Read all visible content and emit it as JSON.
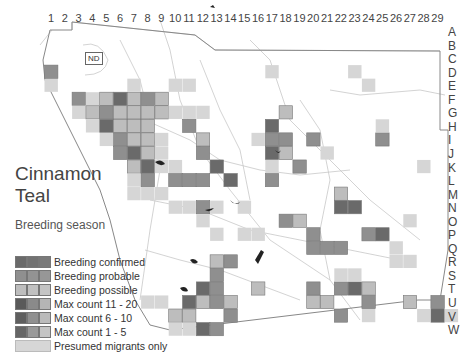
{
  "map": {
    "title_line1": "Cinnamon",
    "title_line2": "Teal",
    "subtitle": "Breeding season",
    "nd_label": "ND",
    "columns": [
      "1",
      "2",
      "3",
      "4",
      "5",
      "6",
      "7",
      "8",
      "9",
      "10",
      "11",
      "12",
      "13",
      "14",
      "15",
      "16",
      "17",
      "18",
      "19",
      "20",
      "21",
      "22",
      "23",
      "24",
      "25",
      "26",
      "27",
      "28",
      "29"
    ],
    "rows": [
      "A",
      "B",
      "C",
      "D",
      "E",
      "F",
      "G",
      "H",
      "I",
      "J",
      "K",
      "L",
      "M",
      "N",
      "O",
      "P",
      "Q",
      "R",
      "S",
      "T",
      "U",
      "V",
      "W"
    ],
    "colors": {
      "confirmed": "#6a6a6a",
      "probable": "#8f8f8f",
      "possible": "#bdbdbd",
      "migrant": "#d6d6d6",
      "border": "#888888",
      "roads": "#c8c8c8",
      "water": "#222222"
    }
  },
  "legend": {
    "items": [
      {
        "label": "Breeding confirmed",
        "swatches": [
          "#6a6a6a",
          "#6a6a6a",
          "#6a6a6a"
        ]
      },
      {
        "label": "Breeding probable",
        "swatches": [
          "#8f8f8f",
          "#8f8f8f",
          "#8f8f8f"
        ]
      },
      {
        "label": "Breeding possible",
        "swatches": [
          "#bdbdbd",
          "#bdbdbd",
          "#bdbdbd"
        ]
      },
      {
        "label": "Max count 11 - 20",
        "swatches": [
          "#5a5a5a",
          "#8a8a8a",
          "#b5b5b5"
        ]
      },
      {
        "label": "Max count 6 - 10",
        "swatches": [
          "#5f5f5f",
          "#909090",
          "#bbbbbb"
        ]
      },
      {
        "label": "Max count 1 - 5",
        "swatches": [
          "#666666",
          "#999999",
          "#c4c4c4"
        ]
      },
      {
        "label": "Presumed migrants only",
        "swatches": [
          "#d6d6d6"
        ]
      }
    ]
  },
  "squares": [
    {
      "c": 1,
      "r": "D",
      "s": "migrant"
    },
    {
      "c": 1,
      "r": "C",
      "s": "probable"
    },
    {
      "c": 3,
      "r": "E",
      "s": "probable"
    },
    {
      "c": 4,
      "r": "E",
      "s": "migrant"
    },
    {
      "c": 5,
      "r": "E",
      "s": "possible"
    },
    {
      "c": 6,
      "r": "E",
      "s": "confirmed"
    },
    {
      "c": 7,
      "r": "E",
      "s": "possible"
    },
    {
      "c": 8,
      "r": "E",
      "s": "probable"
    },
    {
      "c": 9,
      "r": "E",
      "s": "possible"
    },
    {
      "c": 7,
      "r": "D",
      "s": "migrant"
    },
    {
      "c": 10,
      "r": "D",
      "s": "migrant"
    },
    {
      "c": 11,
      "r": "D",
      "s": "migrant"
    },
    {
      "c": 3,
      "r": "F",
      "s": "migrant"
    },
    {
      "c": 4,
      "r": "F",
      "s": "possible"
    },
    {
      "c": 5,
      "r": "F",
      "s": "probable"
    },
    {
      "c": 6,
      "r": "F",
      "s": "possible"
    },
    {
      "c": 7,
      "r": "F",
      "s": "possible"
    },
    {
      "c": 8,
      "r": "F",
      "s": "possible"
    },
    {
      "c": 9,
      "r": "F",
      "s": "possible"
    },
    {
      "c": 10,
      "r": "F",
      "s": "migrant"
    },
    {
      "c": 11,
      "r": "F",
      "s": "migrant"
    },
    {
      "c": 12,
      "r": "F",
      "s": "migrant"
    },
    {
      "c": 4,
      "r": "G",
      "s": "migrant"
    },
    {
      "c": 5,
      "r": "G",
      "s": "confirmed"
    },
    {
      "c": 6,
      "r": "G",
      "s": "possible"
    },
    {
      "c": 7,
      "r": "G",
      "s": "possible"
    },
    {
      "c": 8,
      "r": "G",
      "s": "possible"
    },
    {
      "c": 11,
      "r": "G",
      "s": "probable"
    },
    {
      "c": 5,
      "r": "H",
      "s": "migrant"
    },
    {
      "c": 6,
      "r": "H",
      "s": "probable"
    },
    {
      "c": 7,
      "r": "H",
      "s": "possible"
    },
    {
      "c": 8,
      "r": "H",
      "s": "possible"
    },
    {
      "c": 9,
      "r": "H",
      "s": "migrant"
    },
    {
      "c": 6,
      "r": "I",
      "s": "probable"
    },
    {
      "c": 7,
      "r": "I",
      "s": "confirmed"
    },
    {
      "c": 8,
      "r": "I",
      "s": "possible"
    },
    {
      "c": 9,
      "r": "I",
      "s": "migrant"
    },
    {
      "c": 7,
      "r": "J",
      "s": "possible"
    },
    {
      "c": 8,
      "r": "J",
      "s": "confirmed"
    },
    {
      "c": 9,
      "r": "J",
      "s": "migrant"
    },
    {
      "c": 10,
      "r": "J",
      "s": "migrant"
    },
    {
      "c": 7,
      "r": "K",
      "s": "migrant"
    },
    {
      "c": 8,
      "r": "K",
      "s": "probable"
    },
    {
      "c": 10,
      "r": "K",
      "s": "probable"
    },
    {
      "c": 12,
      "r": "I",
      "s": "probable"
    },
    {
      "c": 13,
      "r": "J",
      "s": "confirmed"
    },
    {
      "c": 14,
      "r": "K",
      "s": "confirmed"
    },
    {
      "c": 11,
      "r": "K",
      "s": "probable"
    },
    {
      "c": 12,
      "r": "K",
      "s": "probable"
    },
    {
      "c": 12,
      "r": "H",
      "s": "possible"
    },
    {
      "c": 16,
      "r": "H",
      "s": "migrant"
    },
    {
      "c": 17,
      "r": "C",
      "s": "migrant"
    },
    {
      "c": 23,
      "r": "C",
      "s": "migrant"
    },
    {
      "c": 24,
      "r": "D",
      "s": "migrant"
    },
    {
      "c": 18,
      "r": "F",
      "s": "possible"
    },
    {
      "c": 17,
      "r": "G",
      "s": "confirmed"
    },
    {
      "c": 17,
      "r": "H",
      "s": "probable"
    },
    {
      "c": 18,
      "r": "H",
      "s": "probable"
    },
    {
      "c": 17,
      "r": "I",
      "s": "confirmed"
    },
    {
      "c": 18,
      "r": "I",
      "s": "possible"
    },
    {
      "c": 19,
      "r": "J",
      "s": "probable"
    },
    {
      "c": 17,
      "r": "J",
      "s": "migrant"
    },
    {
      "c": 17,
      "r": "K",
      "s": "probable"
    },
    {
      "c": 20,
      "r": "H",
      "s": "probable"
    },
    {
      "c": 21,
      "r": "I",
      "s": "migrant"
    },
    {
      "c": 25,
      "r": "H",
      "s": "probable"
    },
    {
      "c": 25,
      "r": "G",
      "s": "migrant"
    },
    {
      "c": 28,
      "r": "J",
      "s": "migrant"
    },
    {
      "c": 22,
      "r": "L",
      "s": "possible"
    },
    {
      "c": 22,
      "r": "M",
      "s": "confirmed"
    },
    {
      "c": 23,
      "r": "M",
      "s": "confirmed"
    },
    {
      "c": 24,
      "r": "O",
      "s": "probable"
    },
    {
      "c": 25,
      "r": "O",
      "s": "confirmed"
    },
    {
      "c": 27,
      "r": "N",
      "s": "migrant"
    },
    {
      "c": 18,
      "r": "N",
      "s": "probable"
    },
    {
      "c": 19,
      "r": "N",
      "s": "possible"
    },
    {
      "c": 15,
      "r": "O",
      "s": "migrant"
    },
    {
      "c": 16,
      "r": "O",
      "s": "migrant"
    },
    {
      "c": 20,
      "r": "O",
      "s": "probable"
    },
    {
      "c": 20,
      "r": "P",
      "s": "probable"
    },
    {
      "c": 21,
      "r": "P",
      "s": "probable"
    },
    {
      "c": 22,
      "r": "P",
      "s": "probable"
    },
    {
      "c": 26,
      "r": "P",
      "s": "migrant"
    },
    {
      "c": 26,
      "r": "Q",
      "s": "migrant"
    },
    {
      "c": 27,
      "r": "Q",
      "s": "migrant"
    },
    {
      "c": 13,
      "r": "O",
      "s": "migrant"
    },
    {
      "c": 15,
      "r": "M",
      "s": "migrant"
    },
    {
      "c": 13,
      "r": "Q",
      "s": "possible"
    },
    {
      "c": 14,
      "r": "Q",
      "s": "probable"
    },
    {
      "c": 13,
      "r": "R",
      "s": "probable"
    },
    {
      "c": 12,
      "r": "S",
      "s": "confirmed"
    },
    {
      "c": 13,
      "r": "S",
      "s": "probable"
    },
    {
      "c": 11,
      "r": "T",
      "s": "confirmed"
    },
    {
      "c": 12,
      "r": "T",
      "s": "possible"
    },
    {
      "c": 13,
      "r": "T",
      "s": "probable"
    },
    {
      "c": 14,
      "r": "T",
      "s": "possible"
    },
    {
      "c": 14,
      "r": "U",
      "s": "probable"
    },
    {
      "c": 10,
      "r": "U",
      "s": "possible"
    },
    {
      "c": 11,
      "r": "U",
      "s": "possible"
    },
    {
      "c": 12,
      "r": "V",
      "s": "confirmed"
    },
    {
      "c": 13,
      "r": "V",
      "s": "probable"
    },
    {
      "c": 16,
      "r": "S",
      "s": "possible"
    },
    {
      "c": 20,
      "r": "S",
      "s": "probable"
    },
    {
      "c": 20,
      "r": "T",
      "s": "possible"
    },
    {
      "c": 21,
      "r": "T",
      "s": "possible"
    },
    {
      "c": 22,
      "r": "S",
      "s": "probable"
    },
    {
      "c": 23,
      "r": "S",
      "s": "confirmed"
    },
    {
      "c": 24,
      "r": "S",
      "s": "possible"
    },
    {
      "c": 22,
      "r": "R",
      "s": "migrant"
    },
    {
      "c": 23,
      "r": "R",
      "s": "migrant"
    },
    {
      "c": 24,
      "r": "T",
      "s": "probable"
    },
    {
      "c": 27,
      "r": "T",
      "s": "possible"
    },
    {
      "c": 29,
      "r": "T",
      "s": "probable"
    },
    {
      "c": 29,
      "r": "U",
      "s": "confirmed"
    },
    {
      "c": 28,
      "r": "U",
      "s": "migrant"
    },
    {
      "c": 30,
      "r": "U",
      "s": "migrant"
    },
    {
      "c": 22,
      "r": "U",
      "s": "probable"
    },
    {
      "c": 24,
      "r": "U",
      "s": "migrant"
    },
    {
      "c": 9,
      "r": "L",
      "s": "migrant"
    },
    {
      "c": 10,
      "r": "M",
      "s": "migrant"
    },
    {
      "c": 11,
      "r": "M",
      "s": "migrant"
    },
    {
      "c": 12,
      "r": "M",
      "s": "probable"
    },
    {
      "c": 13,
      "r": "M",
      "s": "migrant"
    },
    {
      "c": 12,
      "r": "N",
      "s": "migrant"
    },
    {
      "c": 7,
      "r": "L",
      "s": "migrant"
    },
    {
      "c": 8,
      "r": "L",
      "s": "migrant"
    },
    {
      "c": 8,
      "r": "T",
      "s": "migrant"
    },
    {
      "c": 9,
      "r": "T",
      "s": "migrant"
    },
    {
      "c": 10,
      "r": "V",
      "s": "migrant"
    },
    {
      "c": 11,
      "r": "V",
      "s": "migrant"
    }
  ]
}
